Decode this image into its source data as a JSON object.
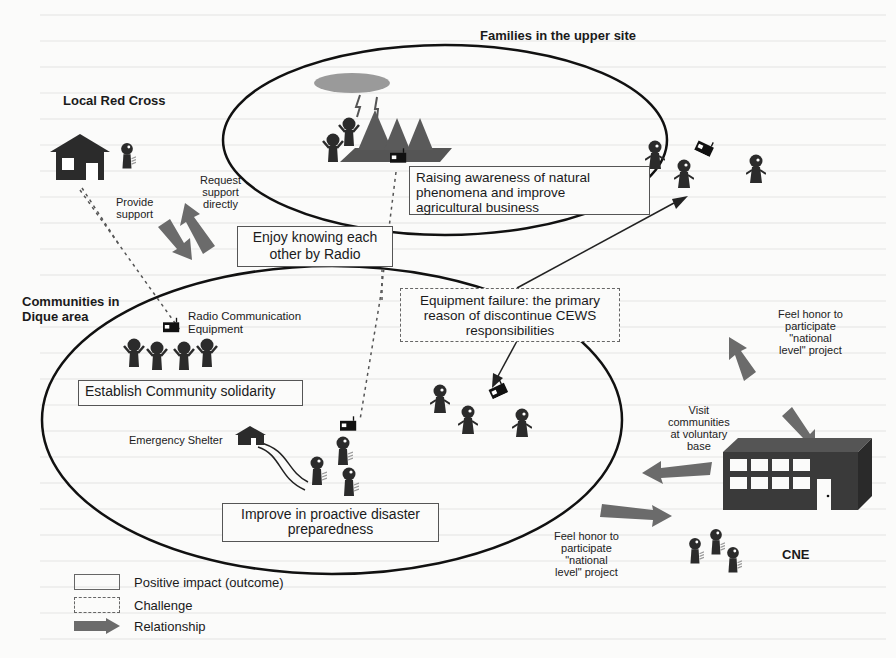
{
  "groups": {
    "local_red_cross": "Local Red Cross",
    "families_upper_site": "Families in the upper site",
    "communities_dique": "Communities in\nDique area",
    "cne": "CNE"
  },
  "arrows": {
    "provide_support": "Provide\nsupport",
    "request_support": "Request\nsupport\ndirectly",
    "feel_honor_top": "Feel honor to\nparticipate\n\"national\nlevel\" project",
    "visit_communities": "Visit\ncommunities\nat voluntary\nbase",
    "feel_honor_bottom": "Feel honor to\nparticipate\n\"national\nlevel\" project"
  },
  "outcomes": {
    "raising_awareness": "Raising awareness of natural\nphenomena and improve\nagricultural business",
    "enjoy_knowing": "Enjoy knowing each\nother by Radio",
    "establish_solidarity": "Establish Community solidarity",
    "improve_preparedness": "Improve in proactive disaster\npreparedness"
  },
  "challenges": {
    "equipment_failure": "Equipment failure: the primary\nreason of discontinue CEWS\nresponsibilities"
  },
  "icon_labels": {
    "radio_equipment": "Radio Communication\nEquipment",
    "emergency_shelter": "Emergency Shelter"
  },
  "legend": {
    "positive": "Positive impact (outcome)",
    "challenge": "Challenge",
    "relationship": "Relationship"
  },
  "colors": {
    "arrow_fill": "#6b6b6b",
    "ellipse_stroke": "#111111",
    "figure_fill": "#2b2b2b",
    "cloud_fill": "#9a9a9a",
    "tree_fill": "#5a5a5a",
    "building_fill": "#3a3a3a"
  }
}
